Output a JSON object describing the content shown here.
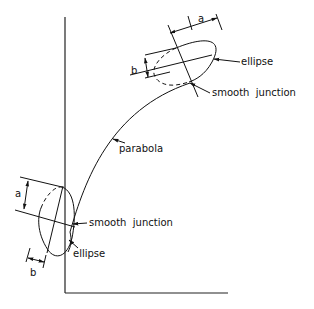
{
  "diagram": {
    "title": "",
    "labels": {
      "top_a": "a",
      "top_b": "b",
      "top_ellipse": "ellipse",
      "top_junction": "smooth  junction",
      "parabola": "parabola",
      "bottom_a": "a",
      "bottom_b": "b",
      "bottom_junction": "smooth  junction",
      "bottom_ellipse": "ellipse"
    },
    "colors": {
      "line": "#111111",
      "background": "#ffffff"
    }
  }
}
